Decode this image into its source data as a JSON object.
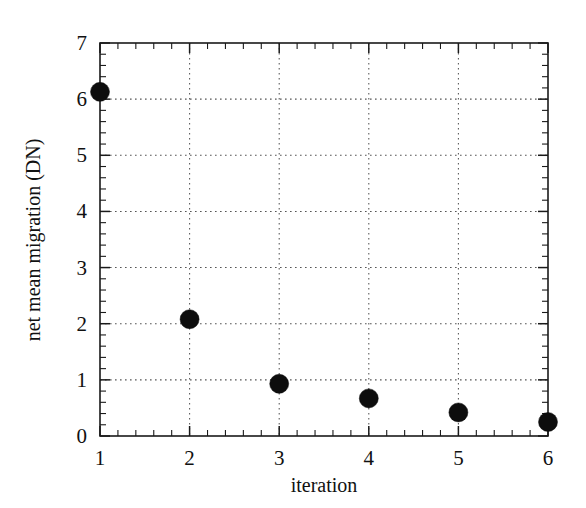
{
  "chart_data": {
    "type": "scatter",
    "title": "",
    "xlabel": "iteration",
    "ylabel": "net mean migration (DN)",
    "x": [
      1,
      2,
      3,
      4,
      5,
      6
    ],
    "values": [
      6.13,
      2.08,
      0.93,
      0.67,
      0.42,
      0.25
    ],
    "series": [
      {
        "name": "net mean migration",
        "points": [
          {
            "x": 1,
            "y": 6.13
          },
          {
            "x": 2,
            "y": 2.08
          },
          {
            "x": 3,
            "y": 0.93
          },
          {
            "x": 4,
            "y": 0.67
          },
          {
            "x": 5,
            "y": 0.42
          },
          {
            "x": 6,
            "y": 0.25
          }
        ]
      }
    ],
    "xlim": [
      1,
      6
    ],
    "ylim": [
      0,
      7
    ],
    "xticks": [
      1,
      2,
      3,
      4,
      5,
      6
    ],
    "yticks": [
      0,
      1,
      2,
      3,
      4,
      5,
      6,
      7
    ],
    "xtick_labels": [
      "1",
      "2",
      "3",
      "4",
      "5",
      "6"
    ],
    "ytick_labels": [
      "0",
      "1",
      "2",
      "3",
      "4",
      "5",
      "6",
      "7"
    ],
    "x_minor_step": 0.2,
    "y_minor_step": 0.2,
    "grid": "dotted-both-axes",
    "legend": "none",
    "marker": "filled-circle",
    "marker_color": "#0d0d0d",
    "background_color": "#ffffff",
    "axis_color": "#1a1a1a",
    "grid_color": "#555555"
  },
  "axes": {
    "x_title": "iteration",
    "y_title": "net mean migration (DN)"
  }
}
